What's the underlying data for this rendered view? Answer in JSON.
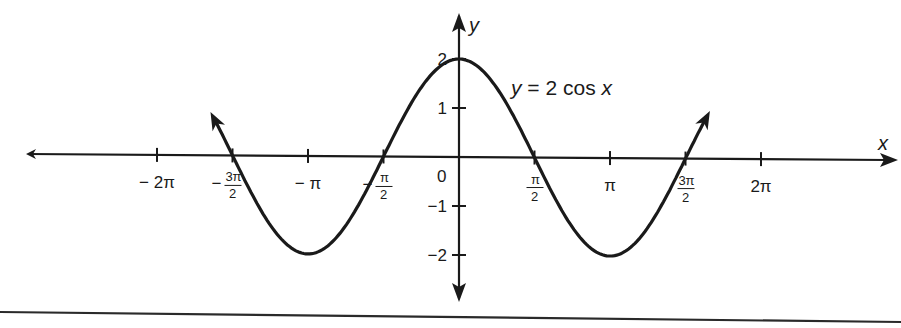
{
  "chart_data": {
    "type": "line",
    "title": "",
    "function": "y = 2 cos x",
    "annotation": {
      "text_parts": [
        "y",
        " = 2 cos ",
        "x"
      ],
      "full": "y = 2 cos x"
    },
    "xlabel": "x",
    "ylabel": "y",
    "xlim": [
      -6.1,
      6.1
    ],
    "ylim": [
      -2.9,
      2.6
    ],
    "grid": false,
    "legend": "none",
    "x_ticks": [
      {
        "value": -6.2832,
        "label": "− 2π",
        "kind": "plain"
      },
      {
        "value": -4.7124,
        "label_num": "3π",
        "label_den": "2",
        "sign": "−",
        "kind": "frac"
      },
      {
        "value": -3.1416,
        "label": "− π",
        "kind": "plain"
      },
      {
        "value": -1.5708,
        "label_num": "π",
        "label_den": "2",
        "sign": "−",
        "kind": "frac"
      },
      {
        "value": 1.5708,
        "label_num": "π",
        "label_den": "2",
        "sign": "",
        "kind": "frac"
      },
      {
        "value": 3.1416,
        "label": "π",
        "kind": "plain"
      },
      {
        "value": 4.7124,
        "label_num": "3π",
        "label_den": "2",
        "sign": "",
        "kind": "frac"
      },
      {
        "value": 6.2832,
        "label": "2π",
        "kind": "plain"
      }
    ],
    "origin_label": "0",
    "y_ticks": [
      {
        "value": 2,
        "label": "2"
      },
      {
        "value": 1,
        "label": "1"
      },
      {
        "value": -1,
        "label": "−1"
      },
      {
        "value": -2,
        "label": "−2"
      }
    ],
    "series": [
      {
        "name": "y = 2 cos x",
        "x_range": [
          -5.05,
          5.1
        ],
        "arrows_at_ends": true,
        "key_points": [
          {
            "x": -4.7124,
            "y": 0
          },
          {
            "x": -3.1416,
            "y": -2
          },
          {
            "x": -1.5708,
            "y": 0
          },
          {
            "x": 0,
            "y": 2
          },
          {
            "x": 1.5708,
            "y": 0
          },
          {
            "x": 3.1416,
            "y": -2
          },
          {
            "x": 4.7124,
            "y": 0
          }
        ]
      }
    ],
    "colors": {
      "ink": "#1a1a1a",
      "background": "#ffffff"
    }
  }
}
